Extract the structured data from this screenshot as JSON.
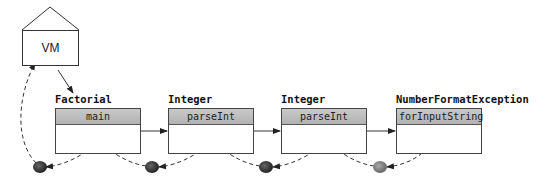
{
  "diagram": {
    "vm": {
      "label": "VM"
    },
    "frames": [
      {
        "class_name": "Factorial",
        "method": "main"
      },
      {
        "class_name": "Integer",
        "method": "parseInt"
      },
      {
        "class_name": "Integer",
        "method": "parseInt"
      },
      {
        "class_name": "NumberFormatException",
        "method": "forInputString"
      }
    ],
    "colors": {
      "line": "#333333",
      "header": "#b8b8b8",
      "dot_dark": "#3a3a3a",
      "dot_light": "#7a7a7a"
    }
  }
}
